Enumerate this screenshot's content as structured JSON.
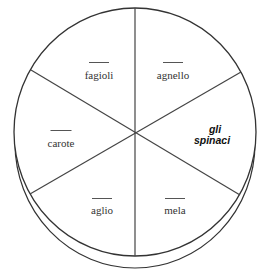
{
  "diagram": {
    "type": "plate-divided-into-six-segments",
    "segments": [
      {
        "id": "fagioli",
        "label": "fagioli",
        "blank": true,
        "x": 99,
        "y": 69
      },
      {
        "id": "agnello",
        "label": "agnello",
        "blank": true,
        "x": 173,
        "y": 69
      },
      {
        "id": "carote",
        "label": "carote",
        "blank": true,
        "x": 61,
        "y": 137
      },
      {
        "id": "spinaci",
        "label_line1": "gli",
        "label_line2": "spinaci",
        "blank": false,
        "x": 212,
        "y": 128
      },
      {
        "id": "aglio",
        "label": "aglio",
        "blank": true,
        "x": 102,
        "y": 204
      },
      {
        "id": "mela",
        "label": "mela",
        "blank": true,
        "x": 175,
        "y": 204
      }
    ],
    "colors": {
      "stroke": "#333333",
      "background": "#ffffff"
    }
  }
}
